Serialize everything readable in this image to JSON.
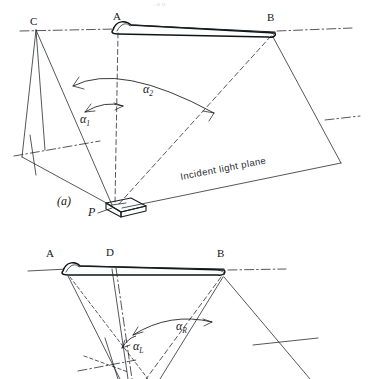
{
  "figure": {
    "title_faint": ". o o",
    "background": "#ffffff",
    "ink_color": "#1c1f23"
  },
  "panel_a": {
    "caption": "(a)",
    "annotation": "Incident light plane",
    "points": [
      {
        "name": "C",
        "label": "C",
        "x": 35,
        "y": 24
      },
      {
        "name": "A",
        "label": "A",
        "x": 117,
        "y": 20
      },
      {
        "name": "B",
        "label": "B",
        "x": 271,
        "y": 22
      },
      {
        "name": "P",
        "label": "P",
        "x": 92,
        "y": 212
      }
    ],
    "angles": [
      {
        "name": "alpha1",
        "symbol": "α",
        "subscript": "1",
        "x": 85,
        "y": 118
      },
      {
        "name": "alpha2",
        "symbol": "α",
        "subscript": "2",
        "x": 150,
        "y": 90
      }
    ]
  },
  "panel_b": {
    "points": [
      {
        "name": "A",
        "label": "A",
        "x": 50,
        "y": 257
      },
      {
        "name": "D",
        "label": "D",
        "x": 110,
        "y": 256
      },
      {
        "name": "B",
        "label": "B",
        "x": 221,
        "y": 257
      }
    ],
    "angles": [
      {
        "name": "alphaL",
        "symbol": "α",
        "subscript": "L",
        "x": 136,
        "y": 345
      },
      {
        "name": "alphaR",
        "symbol": "α",
        "subscript": "R",
        "x": 182,
        "y": 326
      }
    ]
  }
}
